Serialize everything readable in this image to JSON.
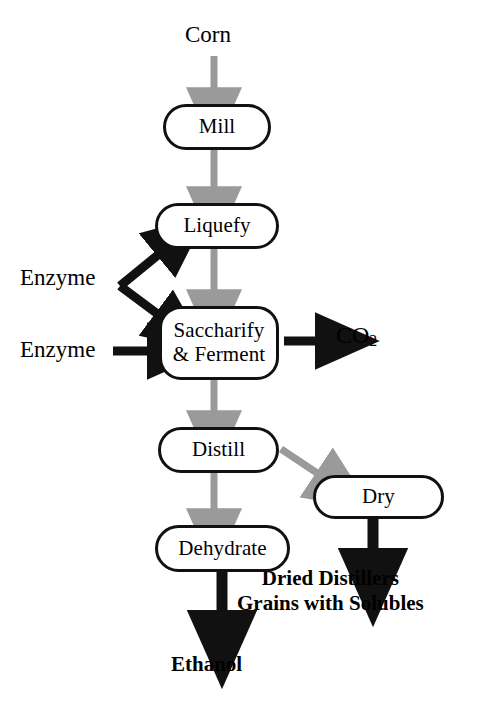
{
  "diagram": {
    "colors": {
      "process_arrow": "#9a9a9a",
      "io_arrow": "#111111",
      "node_border": "#111111",
      "node_fill": "#ffffff",
      "text": "#000000"
    },
    "nodes": [
      {
        "id": "mill",
        "label": "Mill",
        "shape": "stadium"
      },
      {
        "id": "liquefy",
        "label": "Liquefy",
        "shape": "stadium"
      },
      {
        "id": "saccharify",
        "label": "Saccharify\n& Ferment",
        "shape": "rounded"
      },
      {
        "id": "distill",
        "label": "Distill",
        "shape": "stadium"
      },
      {
        "id": "dry",
        "label": "Dry",
        "shape": "stadium"
      },
      {
        "id": "dehydrate",
        "label": "Dehydrate",
        "shape": "stadium"
      }
    ],
    "labels": {
      "corn": "Corn",
      "enzyme_liquefy": "Enzyme",
      "enzyme_ferment": "Enzyme",
      "co2_text": "CO",
      "co2_sub": "2",
      "ddgs": "Dried Distillers\nGrains with Solubles",
      "ethanol": "Ethanol"
    },
    "edges": [
      {
        "id": "corn-to-mill",
        "from": "Corn",
        "to": "Mill",
        "style": "gray"
      },
      {
        "id": "mill-to-liquefy",
        "from": "Mill",
        "to": "Liquefy",
        "style": "gray"
      },
      {
        "id": "liquefy-to-saccharify",
        "from": "Liquefy",
        "to": "Saccharify & Ferment",
        "style": "gray"
      },
      {
        "id": "enzyme-to-liquefy",
        "from": "Enzyme",
        "to": "Liquefy",
        "style": "black"
      },
      {
        "id": "enzyme-to-saccharify-fork",
        "from": "Enzyme",
        "to": "Saccharify & Ferment",
        "style": "black"
      },
      {
        "id": "enzyme2-to-saccharify",
        "from": "Enzyme",
        "to": "Saccharify & Ferment",
        "style": "black"
      },
      {
        "id": "saccharify-to-co2",
        "from": "Saccharify & Ferment",
        "to": "CO2",
        "style": "black"
      },
      {
        "id": "saccharify-to-distill",
        "from": "Saccharify & Ferment",
        "to": "Distill",
        "style": "gray"
      },
      {
        "id": "distill-to-dehydrate",
        "from": "Distill",
        "to": "Dehydrate",
        "style": "gray"
      },
      {
        "id": "distill-to-dry",
        "from": "Distill",
        "to": "Dry",
        "style": "gray"
      },
      {
        "id": "dry-to-ddgs",
        "from": "Dry",
        "to": "Dried Distillers Grains with Solubles",
        "style": "black"
      },
      {
        "id": "dehydrate-to-ethanol",
        "from": "Dehydrate",
        "to": "Ethanol",
        "style": "black"
      }
    ]
  }
}
